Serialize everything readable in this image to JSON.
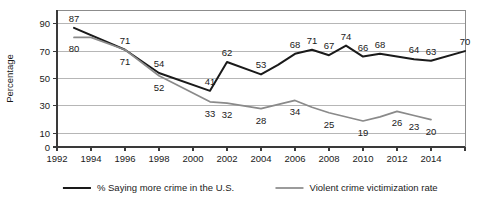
{
  "chart_data": {
    "type": "line",
    "title": "",
    "xlabel": "",
    "ylabel": "Percentage",
    "xlim": [
      1992,
      2016
    ],
    "ylim": [
      0,
      100
    ],
    "grid": true,
    "legend_position": "bottom",
    "x_ticks": [
      "1992",
      "1994",
      "1996",
      "1998",
      "2000",
      "2002",
      "2004",
      "2006",
      "2008",
      "2010",
      "2012",
      "2014"
    ],
    "x_tick_values": [
      1992,
      1994,
      1996,
      1998,
      2000,
      2002,
      2004,
      2006,
      2008,
      2010,
      2012,
      2014
    ],
    "y_ticks": [
      "0",
      "10",
      "30",
      "50",
      "70",
      "90"
    ],
    "y_tick_values": [
      0,
      10,
      30,
      50,
      70,
      90
    ],
    "series": [
      {
        "name": "% Saying more crime in the U.S.",
        "color": "#1a1a1a",
        "width": 2.0,
        "x": [
          1993,
          1996,
          1998,
          2001,
          2002,
          2004,
          2005,
          2006,
          2007,
          2008,
          2009,
          2010,
          2011,
          2013,
          2014,
          2016
        ],
        "values": [
          87,
          71,
          54,
          41,
          62,
          53,
          60,
          68,
          71,
          67,
          74,
          66,
          68,
          64,
          63,
          70
        ],
        "labels": [
          {
            "x": 1993,
            "y": 87,
            "text": "87"
          },
          {
            "x": 1996,
            "y": 71,
            "text": "71"
          },
          {
            "x": 1998,
            "y": 54,
            "text": "54"
          },
          {
            "x": 2001,
            "y": 41,
            "text": "41"
          },
          {
            "x": 2002,
            "y": 62,
            "text": "62"
          },
          {
            "x": 2004,
            "y": 53,
            "text": "53"
          },
          {
            "x": 2006,
            "y": 68,
            "text": "68"
          },
          {
            "x": 2007,
            "y": 71,
            "text": "71"
          },
          {
            "x": 2008,
            "y": 67,
            "text": "67"
          },
          {
            "x": 2009,
            "y": 74,
            "text": "74"
          },
          {
            "x": 2010,
            "y": 66,
            "text": "66"
          },
          {
            "x": 2011,
            "y": 68,
            "text": "68"
          },
          {
            "x": 2013,
            "y": 64,
            "text": "64"
          },
          {
            "x": 2014,
            "y": 63,
            "text": "63"
          },
          {
            "x": 2016,
            "y": 70,
            "text": "70"
          }
        ]
      },
      {
        "name": "Violent crime victimization rate",
        "color": "#8a8a8a",
        "width": 1.7,
        "x": [
          1993,
          1994,
          1996,
          1998,
          2001,
          2002,
          2004,
          2006,
          2007,
          2008,
          2010,
          2011,
          2012,
          2013,
          2014
        ],
        "values": [
          80,
          80,
          71,
          52,
          33,
          32,
          28,
          34,
          29,
          25,
          19,
          22,
          26,
          23,
          20
        ],
        "labels": [
          {
            "x": 1993,
            "y": 80,
            "text": "80"
          },
          {
            "x": 1996,
            "y": 71,
            "text": "71"
          },
          {
            "x": 1998,
            "y": 52,
            "text": "52"
          },
          {
            "x": 2001,
            "y": 33,
            "text": "33"
          },
          {
            "x": 2002,
            "y": 32,
            "text": "32"
          },
          {
            "x": 2004,
            "y": 28,
            "text": "28"
          },
          {
            "x": 2006,
            "y": 34,
            "text": "34"
          },
          {
            "x": 2008,
            "y": 25,
            "text": "25"
          },
          {
            "x": 2010,
            "y": 19,
            "text": "19"
          },
          {
            "x": 2012,
            "y": 26,
            "text": "26"
          },
          {
            "x": 2013,
            "y": 23,
            "text": "23"
          },
          {
            "x": 2014,
            "y": 20,
            "text": "20"
          }
        ]
      }
    ],
    "legend": [
      {
        "label": "% Saying more crime in the U.S.",
        "color": "#1a1a1a",
        "width": 2.0
      },
      {
        "label": "Violent crime victimization rate",
        "color": "#8a8a8a",
        "width": 1.7
      }
    ]
  }
}
